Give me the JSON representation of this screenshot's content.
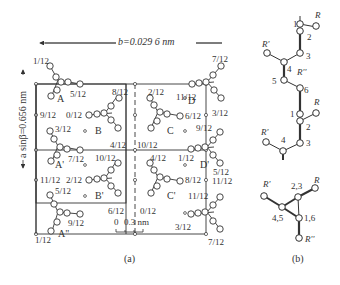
{
  "panel_a": {
    "caption": "(a)",
    "b_axis_label": "b=0.029 6 nm",
    "a_axis_label": "a sinβ=0.656 nm",
    "scale_bar": {
      "start": "0",
      "label": "0.3 nm"
    },
    "molecules": [
      {
        "id": "A",
        "label": "A",
        "heights": [
          "1/12",
          "5/12"
        ]
      },
      {
        "id": "B",
        "label": "B",
        "heights": [
          "8/12",
          "0/12",
          "4/12"
        ]
      },
      {
        "id": "C",
        "label": "C",
        "heights": [
          "2/12",
          "6/12",
          "10/12"
        ]
      },
      {
        "id": "D",
        "label": "D",
        "heights": [
          "7/12",
          "11/12",
          "3/12"
        ]
      },
      {
        "id": "A'",
        "label": "A'",
        "heights": [
          "3/12",
          "7/12",
          "11/12"
        ]
      },
      {
        "id": "B'",
        "label": "B'",
        "heights": [
          "10/12",
          "2/12",
          "6/12"
        ]
      },
      {
        "id": "C'",
        "label": "C'",
        "heights": [
          "4/12",
          "8/12",
          "0/12"
        ]
      },
      {
        "id": "D'",
        "label": "D'",
        "heights": [
          "9/12",
          "1/12",
          "5/12"
        ]
      },
      {
        "id": "A''",
        "label": "A''",
        "heights": [
          "5/12",
          "9/12",
          "1/12"
        ]
      }
    ],
    "labels": {
      "a_top_1": "1/12",
      "a_top_5": "5/12",
      "b_8": "8/12",
      "c_2": "2/12",
      "d_11": "11/12",
      "d_7": "7/12",
      "left_9": "9/12",
      "b_0": "0/12",
      "c_6": "6/12",
      "d_3": "3/12",
      "ap_3": "3/12",
      "d_9": "9/12",
      "ap_7": "7/12",
      "b_4": "4/12",
      "c_10": "10/12",
      "dp_1": "1/12",
      "ap_10": "10/12",
      "cp_4": "4/12",
      "dp_5": "5/12",
      "left_11": "11/12",
      "bp_2": "2/12",
      "cp_8": "8/12",
      "right_11": "11/12",
      "bp_5": "5/12",
      "cp_11": "11/12",
      "bp_6": "6/12",
      "cp_0": "0/12",
      "app_9": "9/12",
      "dp_3": "3/12",
      "app_1": "1/12",
      "dp_7": "7/12",
      "A": "A",
      "B": "B",
      "C": "C",
      "D": "D",
      "Ap": "A'",
      "Bp": "B'",
      "Cp": "C'",
      "Dp": "D'",
      "App": "A\""
    }
  },
  "panel_b": {
    "caption": "(b)",
    "top_chain": {
      "atoms": [
        "1",
        "2",
        "3",
        "4",
        "5",
        "6"
      ],
      "groups": [
        "R",
        "R'",
        "R''"
      ]
    },
    "middle_chain": {
      "atoms": [
        "1",
        "2",
        "3",
        "4"
      ],
      "groups": [
        "R",
        "R'"
      ]
    },
    "bottom_projection": {
      "atoms": [
        "2,3",
        "4,5",
        "1,6"
      ],
      "groups": [
        "R",
        "R'",
        "R''"
      ]
    },
    "labels": {
      "t1": "1",
      "t2": "2",
      "t3": "3",
      "t4": "4",
      "t5": "5",
      "t6": "6",
      "tR": "R",
      "tRp": "R'",
      "tRpp": "R''",
      "m1": "1",
      "m2": "2",
      "m3": "3",
      "m4": "4",
      "mR": "R",
      "mRp": "R'",
      "b23": "2,3",
      "b45": "4,5",
      "b16": "1,6",
      "bR": "R",
      "bRp": "R'",
      "bRpp": "R''"
    }
  }
}
